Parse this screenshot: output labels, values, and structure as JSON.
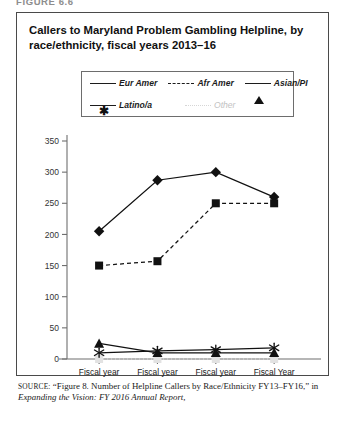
{
  "figure_label": "FIGURE 6.6",
  "chart_title": "Callers to Maryland Problem Gambling Helpline, by race/ethnicity, fiscal years 2013–16",
  "source": {
    "prefix": "SOURCE:",
    "quoted": "“Figure 8. Number of Helpline Callers by Race/Ethnicity FY13–FY16,”",
    "connector": " in ",
    "italic_title": "Expanding the Vision: FY 2016 Annual Report,"
  },
  "legend": {
    "items": [
      {
        "label": "Eur Amer",
        "marker": "diamond",
        "line": "solid",
        "color": "#111111"
      },
      {
        "label": "Afr Amer",
        "marker": "square",
        "line": "dashed",
        "color": "#111111"
      },
      {
        "label": "Asian/PI",
        "marker": "triangle",
        "line": "solid",
        "color": "#111111"
      },
      {
        "label": "Latino/a",
        "marker": "star",
        "line": "solid",
        "color": "#111111"
      },
      {
        "label": "Other",
        "marker": "square",
        "line": "dotted",
        "color": "#e2e2e2"
      }
    ]
  },
  "chart_data": {
    "type": "line",
    "title": "Callers to Maryland Problem Gambling Helpline, by race/ethnicity, fiscal years 2013–16",
    "xlabel": "",
    "ylabel": "",
    "categories": [
      "Fiscal year 2013",
      "Fiscal year 2014",
      "Fiscal year 2015",
      "Fiscal Year 2016"
    ],
    "category_lines": [
      [
        "Fiscal year",
        "2013"
      ],
      [
        "Fiscal year",
        "2014"
      ],
      [
        "Fiscal year",
        "2015"
      ],
      [
        "Fiscal Year",
        "2016"
      ]
    ],
    "ylim": [
      0,
      350
    ],
    "yticks": [
      0,
      50,
      100,
      150,
      200,
      250,
      300,
      350
    ],
    "ytick_labels": [
      "0",
      "50",
      "100",
      "150",
      "200",
      "250",
      "300",
      "350"
    ],
    "grid": false,
    "legend_position": "top-center",
    "series": [
      {
        "name": "Eur Amer",
        "marker": "diamond",
        "line": "solid",
        "color": "#111111",
        "values": [
          205,
          287,
          300,
          260
        ]
      },
      {
        "name": "Afr Amer",
        "marker": "square",
        "line": "dashed",
        "color": "#111111",
        "values": [
          150,
          157,
          250,
          250
        ]
      },
      {
        "name": "Asian/PI",
        "marker": "triangle",
        "line": "solid",
        "color": "#111111",
        "values": [
          25,
          10,
          10,
          10
        ]
      },
      {
        "name": "Latino/a",
        "marker": "star",
        "line": "solid",
        "color": "#111111",
        "values": [
          10,
          13,
          15,
          18
        ]
      },
      {
        "name": "Other",
        "marker": "square",
        "line": "dotted",
        "color": "#e2e2e2",
        "values": [
          0,
          0,
          0,
          0
        ]
      }
    ]
  }
}
